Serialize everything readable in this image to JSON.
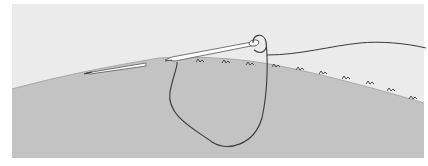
{
  "illustration": {
    "subject": "needle and thread sewing stitches along fabric edge",
    "colors": {
      "page_background": "#ffffff",
      "air_background": "#ebebeb",
      "fabric": "#c3c3c3",
      "fabric_edge": "#a8a8a8",
      "thread": "#3a3a3a",
      "needle_outline": "#555555",
      "needle_fill": "#ffffff",
      "stitch": "#4a4a4a"
    },
    "stitch_count": 10
  }
}
